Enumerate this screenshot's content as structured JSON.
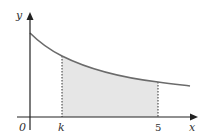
{
  "diagram": {
    "type": "area-under-curve",
    "axes": {
      "x_label": "x",
      "y_label": "y",
      "origin_label": "0"
    },
    "x_ticks": [
      {
        "label": "k"
      },
      {
        "label": "5"
      }
    ],
    "curve": {
      "description": "decreasing curve (e.g. exponential decay) starting on y-axis",
      "color": "#6b6b6b"
    },
    "shaded_region": {
      "from": "k",
      "to": "5",
      "fill": "#e6e6e6",
      "boundary_style": "dotted"
    }
  }
}
